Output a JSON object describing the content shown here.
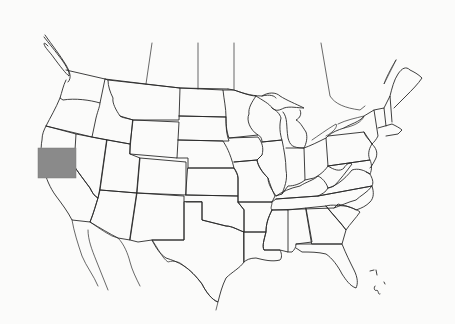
{
  "map": {
    "type": "outline-map",
    "region": "Contiguous United States with partial Canada/Mexico borders",
    "background_color": "#fbfbfa",
    "line_color": "#2a2a2a",
    "highlight": {
      "shape": "rectangle",
      "fill_color": "#8a8a8a",
      "location_description": "Northern California / western Nevada area",
      "bbox_px": {
        "x": 38,
        "y": 148,
        "width": 38,
        "height": 30
      }
    },
    "labels": []
  }
}
